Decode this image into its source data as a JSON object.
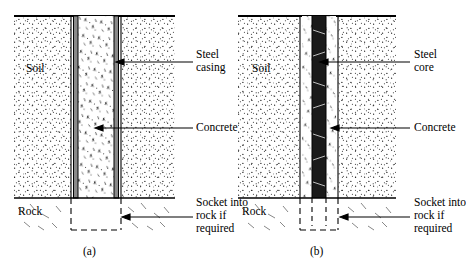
{
  "figure": {
    "title": "",
    "panels": [
      {
        "id": "a",
        "caption": "(a)",
        "labels": {
          "soil": "Soil",
          "rock": "Rock",
          "callout_top": "Steel\ncasing",
          "callout_top_line1": "Steel",
          "callout_top_line2": "casing",
          "callout_mid": "Concrete",
          "callout_bottom_line1": "Socket into",
          "callout_bottom_line2": "rock if",
          "callout_bottom_line3": "required"
        }
      },
      {
        "id": "b",
        "caption": "(b)",
        "labels": {
          "soil": "Soil",
          "rock": "Rock",
          "callout_top": "Steel\ncore",
          "callout_top_line1": "Steel",
          "callout_top_line2": "core",
          "callout_mid": "Concrete",
          "callout_bottom_line1": "Socket into",
          "callout_bottom_line2": "rock if",
          "callout_bottom_line3": "required"
        }
      }
    ],
    "colors": {
      "line": "#000000",
      "steel_fill": "#8a8a8a",
      "soil_fill": "#ffffff",
      "background": "#ffffff"
    }
  }
}
